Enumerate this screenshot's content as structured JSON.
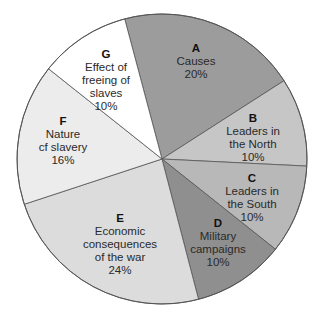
{
  "chart_data": {
    "type": "pie",
    "title": "",
    "slices": [
      {
        "letter": "A",
        "label": "Causes",
        "value": 20,
        "pct": "20%",
        "color": "#9c9c9c",
        "start": -14.9,
        "end": 57.3,
        "lines": [
          "Causes"
        ],
        "lx": 196,
        "ly": 42
      },
      {
        "letter": "B",
        "label": "Leaders in the North",
        "value": 10,
        "pct": "10%",
        "color": "#c6c6c6",
        "start": 57.3,
        "end": 92.8,
        "lines": [
          "Leaders in",
          "the North"
        ],
        "lx": 253,
        "ly": 112
      },
      {
        "letter": "C",
        "label": "Leaders in the South",
        "value": 10,
        "pct": "10%",
        "color": "#b8b8b8",
        "start": 92.8,
        "end": 128.5,
        "lines": [
          "Leaders in",
          "the South"
        ],
        "lx": 252,
        "ly": 172
      },
      {
        "letter": "D",
        "label": "Military campaigns",
        "value": 10,
        "pct": "10%",
        "color": "#8f8f8f",
        "start": 128.5,
        "end": 165.4,
        "lines": [
          "Military",
          "campaigns"
        ],
        "lx": 218,
        "ly": 217
      },
      {
        "letter": "E",
        "label": "Economic consequences of the war",
        "value": 24,
        "pct": "24%",
        "color": "#dcdcdc",
        "start": 165.4,
        "end": 251.8,
        "lines": [
          "Economic",
          "consequences",
          "of the war"
        ],
        "lx": 120,
        "ly": 212
      },
      {
        "letter": "F",
        "label": "Nature of slavery",
        "value": 16,
        "pct": "16%",
        "color": "#ececec",
        "start": 251.8,
        "end": 308.5,
        "lines": [
          "Nature",
          "cf slavery"
        ],
        "lx": 63,
        "ly": 115
      },
      {
        "letter": "G",
        "label": "Effect of freeing of slaves",
        "value": 10,
        "pct": "10%",
        "color": "#ffffff",
        "start": 308.5,
        "end": 345.1,
        "lines": [
          "Effect of",
          "freeing of",
          "slaves"
        ],
        "lx": 106,
        "ly": 48
      }
    ],
    "center": [
      162,
      159
    ],
    "radius": 145,
    "legend": "none"
  }
}
